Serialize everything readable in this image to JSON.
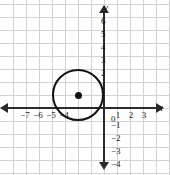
{
  "figure": {
    "title": "",
    "axis_labels": {
      "x": "x",
      "y": "y"
    }
  },
  "chart_data": {
    "type": "scatter",
    "title": "",
    "xlabel": "x",
    "ylabel": "y",
    "grid": true,
    "legend": "none",
    "xlim": [
      -7.8,
      4.3
    ],
    "ylim": [
      -4.8,
      6.5
    ],
    "x_ticks": [
      -7,
      -6,
      -5,
      -4,
      1,
      2,
      3
    ],
    "x_tick_labels": [
      "−7",
      "−6",
      "−5",
      "−4",
      "1",
      "2",
      "3"
    ],
    "y_ticks": [
      6,
      5,
      4,
      3,
      2,
      1,
      -1,
      -2,
      -3,
      -4
    ],
    "y_tick_labels": [
      "6",
      "5",
      "4",
      "3",
      "2",
      "1",
      "−1",
      "−2",
      "−3",
      "−4"
    ],
    "origin_label": "0",
    "unit_px": 13,
    "shapes": [
      {
        "kind": "circle",
        "center": [
          -2,
          1
        ],
        "radius": 2,
        "center_marker": true,
        "stroke": "#111111",
        "fill": "none"
      }
    ],
    "annotations": []
  },
  "colors": {
    "grid": "#d2d2d2",
    "axis": "#2b2b2b",
    "curve": "#111111",
    "background": "#ffffff",
    "text": "#1a1a1a"
  },
  "ticks": {
    "x": [
      {
        "label": "−7",
        "left": 25,
        "top": 111
      },
      {
        "label": "−6",
        "left": 38,
        "top": 111
      },
      {
        "label": "−5",
        "left": 51,
        "top": 111
      },
      {
        "label": "−4",
        "left": 64,
        "top": 111
      },
      {
        "label": "1",
        "left": 118,
        "top": 111
      },
      {
        "label": "2",
        "left": 131,
        "top": 111
      },
      {
        "label": "3",
        "left": 144,
        "top": 111
      }
    ],
    "y": [
      {
        "label": "6",
        "left": 101,
        "top": 17
      },
      {
        "label": "5",
        "left": 101,
        "top": 30
      },
      {
        "label": "4",
        "left": 101,
        "top": 43
      },
      {
        "label": "3",
        "left": 101,
        "top": 56
      },
      {
        "label": "2",
        "left": 101,
        "top": 69
      },
      {
        "label": "1",
        "left": 101,
        "top": 82
      },
      {
        "label": "0",
        "left": 111,
        "top": 115
      },
      {
        "label": "−1",
        "left": 111,
        "top": 121
      },
      {
        "label": "−2",
        "left": 111,
        "top": 134
      },
      {
        "label": "−3",
        "left": 111,
        "top": 147
      },
      {
        "label": "−4",
        "left": 111,
        "top": 160
      }
    ]
  },
  "gridlines": {
    "vertical_px": [
      13,
      26,
      39,
      52,
      65,
      78,
      91,
      104,
      117,
      130,
      143,
      156,
      169
    ],
    "horizontal_px": [
      4,
      17,
      30,
      43,
      56,
      69,
      82,
      95,
      108,
      121,
      134,
      147,
      160,
      173
    ]
  }
}
